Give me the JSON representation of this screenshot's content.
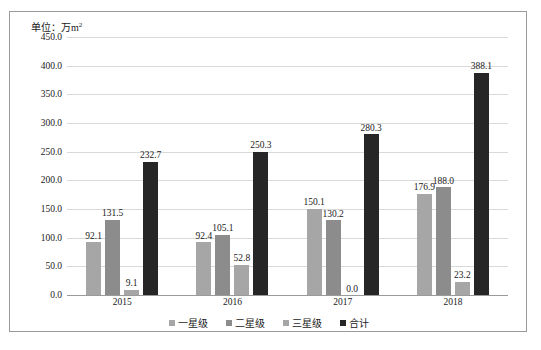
{
  "unit_label": {
    "prefix": "单位：万m",
    "sup": "2"
  },
  "chart_data": {
    "type": "bar",
    "title": "",
    "subtitle": "",
    "xlabel": "",
    "ylabel": "单位：万m²",
    "categories": [
      "2015",
      "2016",
      "2017",
      "2018"
    ],
    "series": [
      {
        "name": "一星级",
        "color": "#a6a6a6",
        "values": [
          92.1,
          92.4,
          150.1,
          176.9
        ]
      },
      {
        "name": "二星级",
        "color": "#8c8c8c",
        "values": [
          131.5,
          105.1,
          130.2,
          188.0
        ]
      },
      {
        "name": "三星级",
        "color": "#a6a6a6",
        "values": [
          9.1,
          52.8,
          0.0,
          23.2
        ]
      },
      {
        "name": "合计",
        "color": "#262626",
        "values": [
          232.7,
          250.3,
          280.3,
          388.1
        ]
      }
    ],
    "value_labels": [
      [
        "92.1",
        "131.5",
        "9.1",
        "232.7"
      ],
      [
        "92.4",
        "105.1",
        "52.8",
        "250.3"
      ],
      [
        "150.1",
        "130.2",
        "0.0",
        "280.3"
      ],
      [
        "176.9",
        "188.0",
        "23.2",
        "388.1"
      ]
    ],
    "ylim": [
      0.0,
      450.0
    ],
    "ytick_step": 50.0,
    "ytick_labels": [
      "450.0",
      "400.0",
      "350.0",
      "300.0",
      "250.0",
      "200.0",
      "150.0",
      "100.0",
      "50.0",
      "0.0"
    ],
    "ytick_values": [
      450.0,
      400.0,
      350.0,
      300.0,
      250.0,
      200.0,
      150.0,
      100.0,
      50.0,
      0.0
    ],
    "grid": true,
    "legend_position": "bottom"
  },
  "legend": {
    "items": [
      {
        "label": "一星级",
        "color": "#a6a6a6"
      },
      {
        "label": "二星级",
        "color": "#8c8c8c"
      },
      {
        "label": "三星级",
        "color": "#a6a6a6"
      },
      {
        "label": "合计",
        "color": "#262626"
      }
    ]
  },
  "colors": {
    "frame_border": "#9a9a9a",
    "gridline": "#d9d9d9",
    "axis_line": "#9a9a9a",
    "background": "#ffffff",
    "text": "#1a1a1a"
  }
}
